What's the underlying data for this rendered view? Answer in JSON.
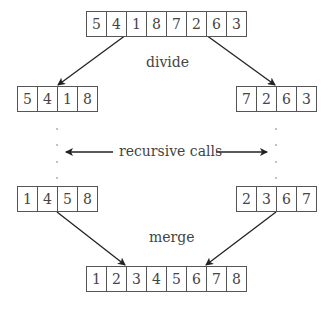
{
  "diagram": {
    "arrays": {
      "input": [
        5,
        4,
        1,
        8,
        7,
        2,
        6,
        3
      ],
      "left_half": [
        5,
        4,
        1,
        8
      ],
      "right_half": [
        7,
        2,
        6,
        3
      ],
      "left_sorted": [
        1,
        4,
        5,
        8
      ],
      "right_sorted": [
        2,
        3,
        6,
        7
      ],
      "output": [
        1,
        2,
        3,
        4,
        5,
        6,
        7,
        8
      ]
    },
    "labels": {
      "divide": "divide",
      "recursive_calls": "recursive calls",
      "merge": "merge"
    },
    "colors": {
      "stroke": "#333333",
      "text": "#444444",
      "background": "#ffffff"
    }
  }
}
